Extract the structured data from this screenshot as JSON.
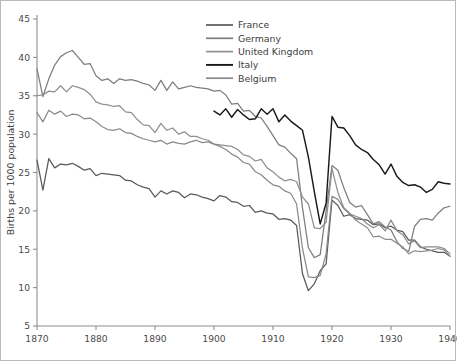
{
  "chart_data": {
    "type": "line",
    "title": "",
    "xlabel": "",
    "ylabel": "Births per 1000 population",
    "xlim": [
      1870,
      1940
    ],
    "ylim": [
      5,
      45
    ],
    "xticks": [
      1870,
      1880,
      1890,
      1900,
      1910,
      1920,
      1930,
      1940
    ],
    "yticks": [
      5,
      10,
      15,
      20,
      25,
      30,
      35,
      40,
      45
    ],
    "grid": false,
    "legend_position": "top-right",
    "series": [
      {
        "name": "France",
        "color": "#595959",
        "width": 1.25,
        "x": [
          1870,
          1871,
          1872,
          1873,
          1874,
          1875,
          1876,
          1877,
          1878,
          1879,
          1880,
          1881,
          1882,
          1883,
          1884,
          1885,
          1886,
          1887,
          1888,
          1889,
          1890,
          1891,
          1892,
          1893,
          1894,
          1895,
          1896,
          1897,
          1898,
          1899,
          1900,
          1901,
          1902,
          1903,
          1904,
          1905,
          1906,
          1907,
          1908,
          1909,
          1910,
          1911,
          1912,
          1913,
          1914,
          1915,
          1916,
          1917,
          1918,
          1919,
          1920,
          1921,
          1922,
          1923,
          1924,
          1925,
          1926,
          1927,
          1928,
          1929,
          1930,
          1931,
          1932,
          1933,
          1934,
          1935,
          1936,
          1937,
          1938,
          1939,
          1940
        ],
        "y": [
          26.6,
          22.7,
          26.8,
          25.6,
          26.1,
          26.0,
          26.2,
          25.8,
          25.3,
          25.5,
          24.6,
          24.9,
          24.8,
          24.7,
          24.6,
          24.0,
          23.9,
          23.4,
          23.1,
          22.9,
          21.8,
          22.6,
          22.2,
          22.6,
          22.4,
          21.7,
          22.2,
          22.1,
          21.8,
          21.6,
          21.3,
          22.0,
          21.8,
          21.2,
          21.1,
          20.6,
          20.7,
          19.8,
          20.0,
          19.7,
          19.6,
          18.9,
          19.0,
          18.8,
          18.1,
          11.8,
          9.6,
          10.5,
          12.2,
          13.1,
          21.4,
          20.7,
          19.3,
          19.5,
          19.0,
          18.9,
          18.8,
          18.2,
          18.3,
          17.8,
          18.0,
          17.5,
          17.3,
          16.2,
          16.2,
          15.3,
          15.0,
          14.8,
          14.6,
          14.6,
          14.1
        ]
      },
      {
        "name": "Germany",
        "color": "#7d7d7d",
        "width": 1.25,
        "x": [
          1870,
          1871,
          1872,
          1873,
          1874,
          1875,
          1876,
          1877,
          1878,
          1879,
          1880,
          1881,
          1882,
          1883,
          1884,
          1885,
          1886,
          1887,
          1888,
          1889,
          1890,
          1891,
          1892,
          1893,
          1894,
          1895,
          1896,
          1897,
          1898,
          1899,
          1900,
          1901,
          1902,
          1903,
          1904,
          1905,
          1906,
          1907,
          1908,
          1909,
          1910,
          1911,
          1912,
          1913,
          1914,
          1915,
          1916,
          1917,
          1918,
          1919,
          1920,
          1921,
          1922,
          1923,
          1924,
          1925,
          1926,
          1927,
          1928,
          1929,
          1930,
          1931,
          1932,
          1933,
          1934,
          1935,
          1936,
          1937,
          1938,
          1939,
          1940
        ],
        "y": [
          38.5,
          34.9,
          37.2,
          39.0,
          40.1,
          40.6,
          40.9,
          40.0,
          39.1,
          39.2,
          37.6,
          37.0,
          37.2,
          36.6,
          37.2,
          37.0,
          37.1,
          36.9,
          36.6,
          36.4,
          35.7,
          37.0,
          35.7,
          36.8,
          35.9,
          36.1,
          36.3,
          36.1,
          36.0,
          35.9,
          35.6,
          35.7,
          35.1,
          33.9,
          34.0,
          33.0,
          33.1,
          32.3,
          32.1,
          31.0,
          29.8,
          28.6,
          28.3,
          27.5,
          26.8,
          20.4,
          15.2,
          13.9,
          14.3,
          20.0,
          25.9,
          25.3,
          23.0,
          21.1,
          20.5,
          20.7,
          19.5,
          18.3,
          18.6,
          17.9,
          17.5,
          16.0,
          15.1,
          14.7,
          18.0,
          18.9,
          19.0,
          18.8,
          19.7,
          20.4,
          20.6
        ]
      },
      {
        "name": "United Kingdom",
        "color": "#8f8f8f",
        "width": 1.25,
        "x": [
          1870,
          1871,
          1872,
          1873,
          1874,
          1875,
          1876,
          1877,
          1878,
          1879,
          1880,
          1881,
          1882,
          1883,
          1884,
          1885,
          1886,
          1887,
          1888,
          1889,
          1890,
          1891,
          1892,
          1893,
          1894,
          1895,
          1896,
          1897,
          1898,
          1899,
          1900,
          1901,
          1902,
          1903,
          1904,
          1905,
          1906,
          1907,
          1908,
          1909,
          1910,
          1911,
          1912,
          1913,
          1914,
          1915,
          1916,
          1917,
          1918,
          1919,
          1920,
          1921,
          1922,
          1923,
          1924,
          1925,
          1926,
          1927,
          1928,
          1929,
          1930,
          1931,
          1932,
          1933,
          1934,
          1935,
          1936,
          1937,
          1938,
          1939,
          1940
        ],
        "y": [
          35.0,
          35.1,
          35.6,
          35.5,
          36.3,
          35.5,
          36.3,
          36.1,
          35.8,
          35.2,
          34.2,
          33.9,
          33.8,
          33.6,
          33.7,
          32.9,
          32.8,
          31.9,
          31.2,
          31.1,
          30.2,
          31.4,
          30.5,
          30.8,
          30.0,
          30.3,
          29.7,
          29.7,
          29.4,
          29.2,
          28.7,
          28.6,
          28.5,
          28.4,
          28.0,
          27.3,
          27.1,
          26.5,
          26.7,
          25.6,
          25.1,
          24.4,
          23.9,
          24.1,
          23.8,
          21.8,
          20.9,
          17.8,
          17.7,
          18.5,
          25.5,
          22.4,
          20.4,
          19.7,
          18.8,
          18.3,
          17.8,
          16.6,
          16.7,
          16.3,
          16.3,
          15.8,
          15.3,
          14.4,
          14.8,
          14.7,
          14.8,
          14.9,
          15.1,
          14.9,
          14.1
        ]
      },
      {
        "name": "Italy",
        "color": "#1a1a1a",
        "width": 1.45,
        "x": [
          1900,
          1901,
          1902,
          1903,
          1904,
          1905,
          1906,
          1907,
          1908,
          1909,
          1910,
          1911,
          1912,
          1913,
          1914,
          1915,
          1916,
          1917,
          1918,
          1919,
          1920,
          1921,
          1922,
          1923,
          1924,
          1925,
          1926,
          1927,
          1928,
          1929,
          1930,
          1931,
          1932,
          1933,
          1934,
          1935,
          1936,
          1937,
          1938,
          1939,
          1940
        ],
        "y": [
          33.0,
          32.5,
          33.3,
          32.2,
          33.2,
          32.5,
          31.9,
          32.0,
          33.3,
          32.6,
          33.3,
          31.6,
          32.5,
          31.7,
          31.1,
          30.5,
          27.0,
          22.5,
          18.3,
          21.0,
          32.3,
          30.9,
          30.8,
          29.8,
          28.6,
          28.0,
          27.6,
          26.7,
          26.0,
          24.8,
          26.1,
          24.5,
          23.7,
          23.3,
          23.4,
          23.1,
          22.4,
          22.8,
          23.8,
          23.6,
          23.5
        ]
      },
      {
        "name": "Belgium",
        "color": "#8a8a8a",
        "width": 1.25,
        "x": [
          1870,
          1871,
          1872,
          1873,
          1874,
          1875,
          1876,
          1877,
          1878,
          1879,
          1880,
          1881,
          1882,
          1883,
          1884,
          1885,
          1886,
          1887,
          1888,
          1889,
          1890,
          1891,
          1892,
          1893,
          1894,
          1895,
          1896,
          1897,
          1898,
          1899,
          1900,
          1901,
          1902,
          1903,
          1904,
          1905,
          1906,
          1907,
          1908,
          1909,
          1910,
          1911,
          1912,
          1913,
          1914,
          1915,
          1916,
          1917,
          1918,
          1919,
          1920,
          1921,
          1922,
          1923,
          1924,
          1925,
          1926,
          1927,
          1928,
          1929,
          1930,
          1931,
          1932,
          1933,
          1934,
          1935,
          1936,
          1937,
          1938,
          1939,
          1940
        ],
        "y": [
          32.8,
          31.6,
          33.1,
          32.6,
          33.0,
          32.3,
          32.6,
          32.5,
          32.0,
          32.1,
          31.6,
          31.0,
          30.6,
          30.5,
          30.7,
          30.2,
          30.1,
          29.7,
          29.4,
          29.2,
          29.0,
          29.2,
          28.7,
          29.0,
          28.8,
          28.7,
          29.0,
          29.2,
          28.9,
          29.0,
          28.7,
          28.4,
          28.0,
          27.4,
          27.0,
          26.3,
          26.1,
          25.1,
          24.7,
          24.0,
          23.4,
          23.2,
          22.6,
          22.3,
          20.9,
          15.1,
          11.4,
          11.3,
          11.6,
          14.4,
          21.9,
          21.5,
          20.3,
          19.6,
          19.3,
          19.0,
          18.3,
          17.8,
          18.2,
          17.4,
          18.8,
          17.4,
          16.9,
          15.7,
          16.1,
          15.2,
          15.3,
          15.3,
          15.3,
          15.1,
          14.4
        ]
      }
    ]
  },
  "legend": {
    "entries": [
      {
        "label": "France"
      },
      {
        "label": "Germany"
      },
      {
        "label": "United Kingdom"
      },
      {
        "label": "Italy"
      },
      {
        "label": "Belgium"
      }
    ]
  },
  "axis": {
    "y_title": "Births per 1000 population",
    "x_tick_labels": [
      "1870",
      "1880",
      "1890",
      "1900",
      "1910",
      "1920",
      "1930",
      "1940"
    ],
    "y_tick_labels": [
      "5",
      "10",
      "15",
      "20",
      "25",
      "30",
      "35",
      "40",
      "45"
    ]
  },
  "style": {
    "axis_color": "#8e8e8e",
    "text_color": "#3d3d3d",
    "background": "#ffffff"
  }
}
